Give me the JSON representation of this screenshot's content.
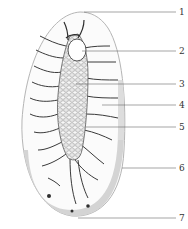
{
  "figure": {
    "labels": [
      {
        "id": "1",
        "text": "1",
        "y": 12
      },
      {
        "id": "2",
        "text": "2",
        "y": 51
      },
      {
        "id": "3",
        "text": "3",
        "y": 84
      },
      {
        "id": "4",
        "text": "4",
        "y": 105
      },
      {
        "id": "5",
        "text": "5",
        "y": 127
      },
      {
        "id": "6",
        "text": "6",
        "y": 168
      },
      {
        "id": "7",
        "text": "7",
        "y": 218
      }
    ]
  },
  "colors": {
    "outline": "#b8b8b8",
    "wall": "#c9c9c9",
    "granule": "#9a9a9a",
    "branch": "#3a3a3a",
    "leader": "#555555"
  }
}
